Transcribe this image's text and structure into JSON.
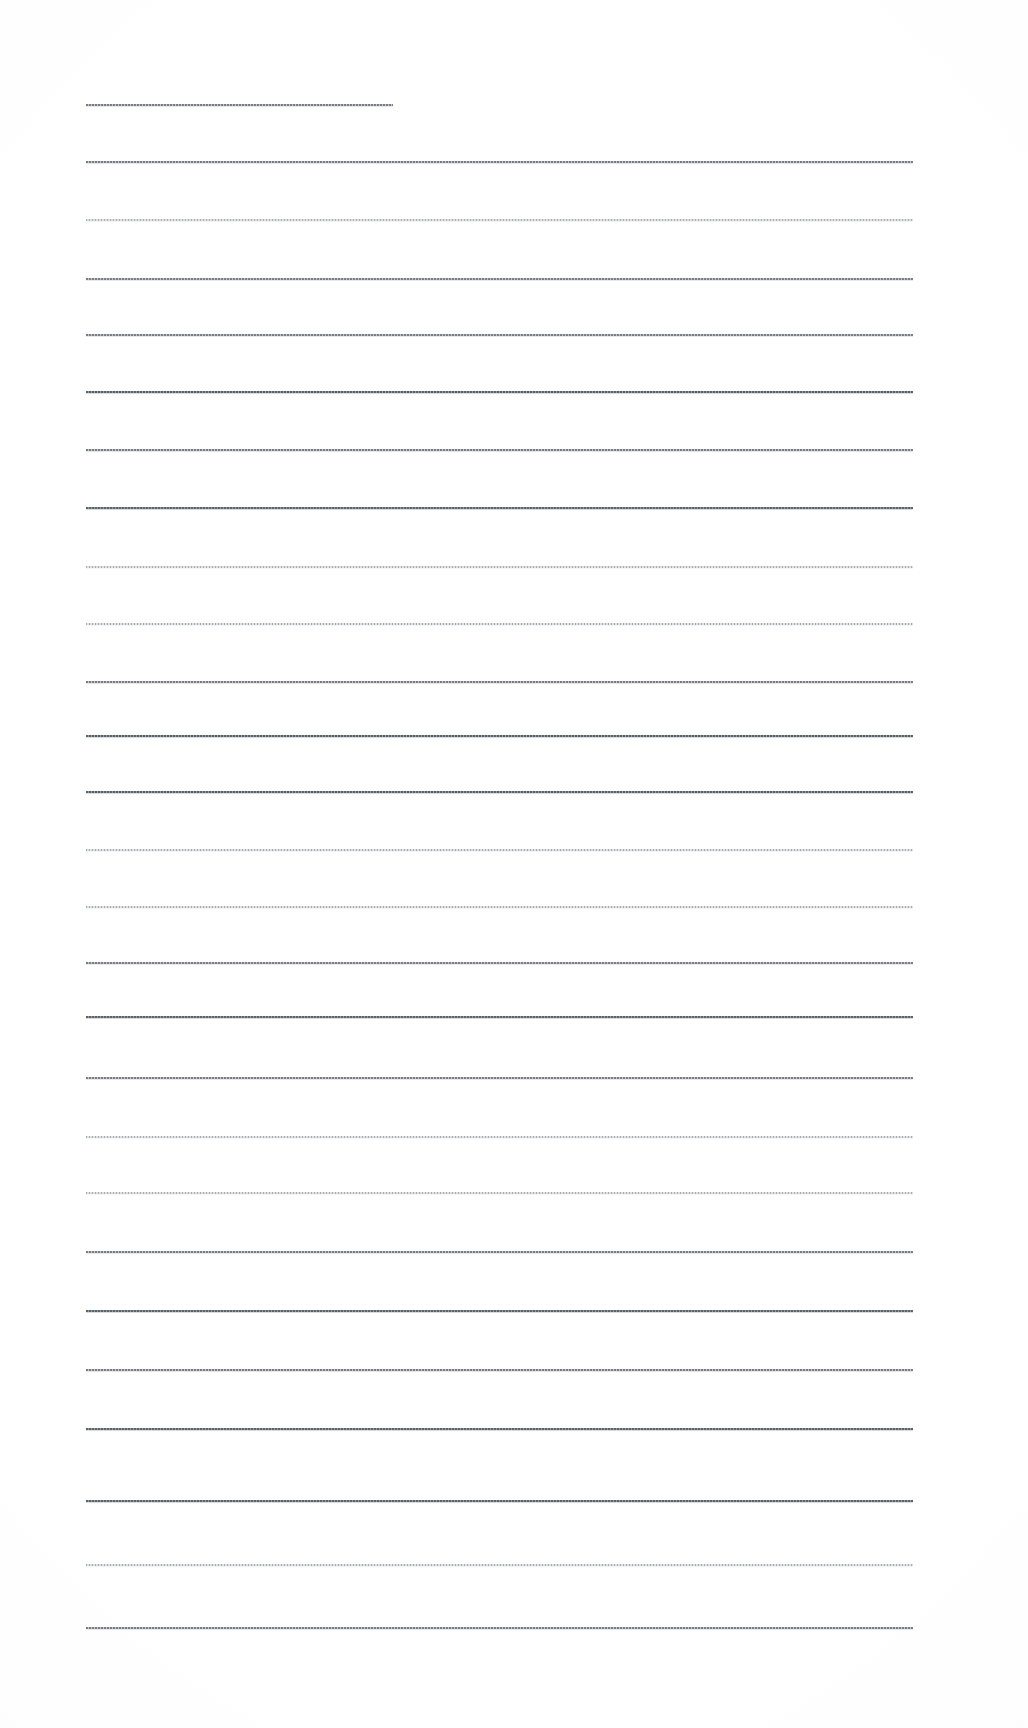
{
  "document": {
    "kind": "ruled-paper-scan",
    "title": "Blank lined page",
    "page_width": 1028,
    "page_height": 1728,
    "background_color": "#ffffff",
    "ink_color": "#6e747c",
    "visible_text": "",
    "ruling": {
      "line_count": 25,
      "left_margin_x": 86,
      "right_margin_x": 913,
      "first_line_y": 104,
      "last_line_y": 1627,
      "line_spacing": 63.4,
      "full_line_start_x": 86,
      "full_line_end_x": 913
    },
    "lines": [
      {
        "index": 1,
        "y": 104,
        "x1": 86,
        "x2": 393,
        "tone": "medium",
        "partial": true
      },
      {
        "index": 2,
        "y": 161,
        "x1": 86,
        "x2": 913,
        "tone": "medium",
        "partial": false
      },
      {
        "index": 3,
        "y": 219,
        "x1": 86,
        "x2": 913,
        "tone": "faint",
        "partial": false
      },
      {
        "index": 4,
        "y": 278,
        "x1": 86,
        "x2": 913,
        "tone": "medium",
        "partial": false
      },
      {
        "index": 5,
        "y": 334,
        "x1": 86,
        "x2": 913,
        "tone": "medium",
        "partial": false
      },
      {
        "index": 6,
        "y": 391,
        "x1": 86,
        "x2": 913,
        "tone": "dark",
        "partial": false
      },
      {
        "index": 7,
        "y": 449,
        "x1": 86,
        "x2": 913,
        "tone": "medium",
        "partial": false
      },
      {
        "index": 8,
        "y": 507,
        "x1": 86,
        "x2": 913,
        "tone": "dark",
        "partial": false
      },
      {
        "index": 9,
        "y": 566,
        "x1": 86,
        "x2": 913,
        "tone": "faint",
        "partial": false
      },
      {
        "index": 10,
        "y": 623,
        "x1": 86,
        "x2": 913,
        "tone": "faint",
        "partial": false
      },
      {
        "index": 11,
        "y": 681,
        "x1": 86,
        "x2": 913,
        "tone": "medium",
        "partial": false
      },
      {
        "index": 12,
        "y": 735,
        "x1": 86,
        "x2": 913,
        "tone": "dark",
        "partial": false
      },
      {
        "index": 13,
        "y": 791,
        "x1": 86,
        "x2": 913,
        "tone": "dark",
        "partial": false
      },
      {
        "index": 14,
        "y": 849,
        "x1": 86,
        "x2": 913,
        "tone": "faint",
        "partial": false
      },
      {
        "index": 15,
        "y": 906,
        "x1": 86,
        "x2": 913,
        "tone": "faint",
        "partial": false
      },
      {
        "index": 16,
        "y": 962,
        "x1": 86,
        "x2": 913,
        "tone": "medium",
        "partial": false
      },
      {
        "index": 17,
        "y": 1016,
        "x1": 86,
        "x2": 913,
        "tone": "dark",
        "partial": false
      },
      {
        "index": 18,
        "y": 1077,
        "x1": 86,
        "x2": 913,
        "tone": "medium",
        "partial": false
      },
      {
        "index": 19,
        "y": 1136,
        "x1": 86,
        "x2": 913,
        "tone": "faint",
        "partial": false
      },
      {
        "index": 20,
        "y": 1192,
        "x1": 86,
        "x2": 913,
        "tone": "faint",
        "partial": false
      },
      {
        "index": 21,
        "y": 1251,
        "x1": 86,
        "x2": 913,
        "tone": "medium",
        "partial": false
      },
      {
        "index": 22,
        "y": 1310,
        "x1": 86,
        "x2": 913,
        "tone": "dark",
        "partial": false
      },
      {
        "index": 23,
        "y": 1369,
        "x1": 86,
        "x2": 913,
        "tone": "medium",
        "partial": false
      },
      {
        "index": 24,
        "y": 1428,
        "x1": 86,
        "x2": 913,
        "tone": "dark",
        "partial": false
      },
      {
        "index": 25,
        "y": 1500,
        "x1": 86,
        "x2": 913,
        "tone": "dark",
        "partial": false
      },
      {
        "index": 26,
        "y": 1564,
        "x1": 86,
        "x2": 913,
        "tone": "faint",
        "partial": false
      },
      {
        "index": 27,
        "y": 1627,
        "x1": 86,
        "x2": 913,
        "tone": "medium",
        "partial": false
      }
    ]
  }
}
